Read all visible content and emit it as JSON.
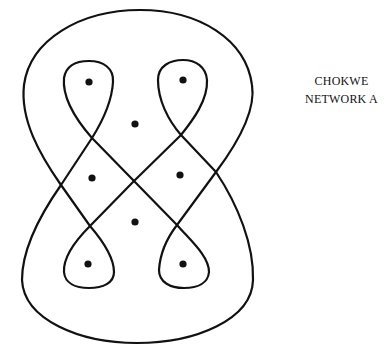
{
  "caption": {
    "line1": "CHOKWE",
    "line2": "NETWORK A"
  },
  "diagram": {
    "type": "sona / lusona line drawing",
    "line_color": "#111111",
    "background": "#ffffff",
    "dots": [
      {
        "x": 89,
        "y": 82
      },
      {
        "x": 183,
        "y": 80
      },
      {
        "x": 135,
        "y": 124
      },
      {
        "x": 92,
        "y": 178
      },
      {
        "x": 180,
        "y": 175
      },
      {
        "x": 135,
        "y": 222
      },
      {
        "x": 88,
        "y": 264
      },
      {
        "x": 183,
        "y": 264
      }
    ]
  }
}
